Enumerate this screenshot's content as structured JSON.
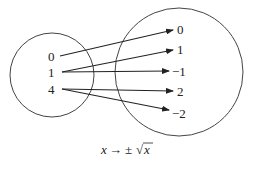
{
  "diagram": {
    "type": "mapping",
    "domain_set": {
      "elements": [
        "0",
        "1",
        "4"
      ]
    },
    "codomain_set": {
      "elements": [
        "0",
        "1",
        "−1",
        "2",
        "−2"
      ]
    },
    "mappings": [
      {
        "from": "0",
        "to": "0"
      },
      {
        "from": "1",
        "to": "1"
      },
      {
        "from": "1",
        "to": "−1"
      },
      {
        "from": "4",
        "to": "2"
      },
      {
        "from": "4",
        "to": "−2"
      }
    ],
    "caption": {
      "var": "x",
      "arrow": "→",
      "pm": "±",
      "sqrt": "√",
      "radicand": "x"
    },
    "colors": {
      "stroke": "#333333",
      "text": "#222222",
      "background": "#ffffff"
    }
  }
}
